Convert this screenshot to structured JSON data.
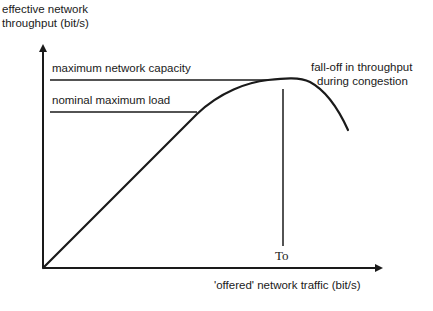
{
  "diagram": {
    "y_axis_label_line1": "effective network",
    "y_axis_label_line2": "throughput (bit/s)",
    "x_axis_label": "'offered' network traffic (bit/s)",
    "max_capacity_label": "maximum network capacity",
    "nominal_load_label": "nominal maximum load",
    "falloff_label_line1": "fall-off in throughput",
    "falloff_label_line2": "during congestion",
    "marker_label": "To"
  },
  "colors": {
    "line": "#1a1a1a",
    "background": "#ffffff"
  }
}
